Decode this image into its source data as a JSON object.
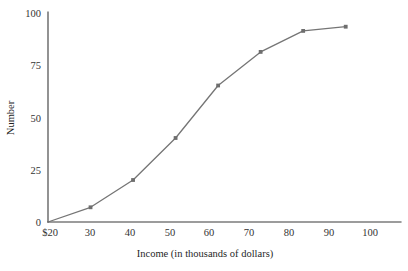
{
  "chart_data": {
    "type": "line",
    "title": "",
    "subtitle": "",
    "xlabel": "Income (in thousands of dollars)",
    "ylabel": "Number",
    "x": [
      20,
      30,
      40,
      50,
      60,
      70,
      80,
      90
    ],
    "values": [
      0,
      7,
      20,
      40,
      65,
      81,
      91,
      93
    ],
    "series": [
      {
        "name": "Number",
        "x": [
          20,
          30,
          40,
          50,
          60,
          70,
          80,
          90
        ],
        "values": [
          0,
          7,
          20,
          40,
          65,
          81,
          91,
          93
        ]
      }
    ],
    "xlim": [
      20,
      103
    ],
    "ylim": [
      0,
      100
    ],
    "xticks": [
      20,
      30,
      40,
      50,
      60,
      70,
      80,
      90,
      100
    ],
    "xticklabels": [
      "$20",
      "30",
      "40",
      "50",
      "60",
      "70",
      "80",
      "90",
      "100"
    ],
    "yticks": [
      0,
      25,
      50,
      75,
      100
    ],
    "yticklabels": [
      "0",
      "25",
      "50",
      "75",
      "100"
    ],
    "grid": false,
    "legend": false,
    "legend_position": "none",
    "markers": "square",
    "colors": {
      "line": "#757575",
      "marker": "#6e6e6e",
      "axis": "#3a3a3a",
      "text": "#333333",
      "background": "#ffffff"
    }
  }
}
